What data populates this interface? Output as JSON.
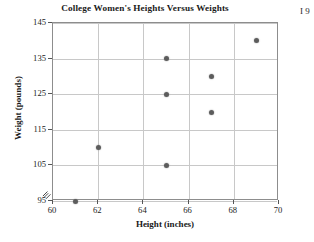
{
  "chart_data": {
    "type": "scatter",
    "title": "College Women's Heights Versus Weights",
    "xlabel": "Height (inches)",
    "ylabel": "Weight (pounds)",
    "xlim": [
      60,
      70
    ],
    "ylim": [
      95,
      145
    ],
    "xticks": [
      60,
      62,
      64,
      66,
      68,
      70
    ],
    "xtick_labels": [
      "60",
      "62",
      "64",
      "66",
      "68",
      "70"
    ],
    "yticks": [
      95,
      105,
      115,
      125,
      135,
      145
    ],
    "ytick_labels": [
      "95",
      "105",
      "115",
      "125",
      "135",
      "145"
    ],
    "grid": true,
    "grid_x_values": [
      62,
      64,
      66,
      68
    ],
    "grid_y_values": [
      95,
      105,
      115,
      125,
      135,
      145
    ],
    "legend": null,
    "axis_break": true,
    "axis_break_symbol": "zigzag",
    "marker_color": "#5c5c5c",
    "grid_color": "#c8c8c8",
    "frame_color": "#8d8d8d",
    "points": [
      {
        "x": 61,
        "y": 95
      },
      {
        "x": 62,
        "y": 110
      },
      {
        "x": 65,
        "y": 105
      },
      {
        "x": 65,
        "y": 125
      },
      {
        "x": 65,
        "y": 135
      },
      {
        "x": 67,
        "y": 120
      },
      {
        "x": 67,
        "y": 130
      },
      {
        "x": 69,
        "y": 140
      }
    ],
    "x": [
      61,
      62,
      65,
      65,
      65,
      67,
      67,
      69
    ],
    "values": [
      95,
      110,
      105,
      125,
      135,
      120,
      130,
      140
    ]
  },
  "margin_notes": {
    "right_edge_fragment": "I\n9"
  }
}
